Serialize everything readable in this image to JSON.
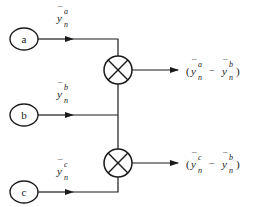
{
  "diagram": {
    "type": "signal-flow",
    "colors": {
      "stroke": "#1a1a1a",
      "background": "#ffffff"
    },
    "nodes": [
      {
        "id": "a",
        "label": "a",
        "shape": "ellipse"
      },
      {
        "id": "b",
        "label": "b",
        "shape": "ellipse"
      },
      {
        "id": "c",
        "label": "c",
        "shape": "ellipse"
      }
    ],
    "signals": [
      {
        "from": "a",
        "base": "y",
        "bar": "¯",
        "sup": "a",
        "sub": "n"
      },
      {
        "from": "b",
        "base": "y",
        "bar": "¯",
        "sup": "b",
        "sub": "n"
      },
      {
        "from": "c",
        "base": "y",
        "bar": "¯",
        "sup": "c",
        "sub": "n"
      }
    ],
    "multipliers": [
      {
        "id": "mult-1",
        "symbol": "⊗",
        "inputs": [
          "a",
          "b"
        ]
      },
      {
        "id": "mult-2",
        "symbol": "⊗",
        "inputs": [
          "b",
          "c"
        ]
      }
    ],
    "outputs": [
      {
        "from": "mult-1",
        "open": "(",
        "t1_sup": "a",
        "t1_sub": "n",
        "minus": "−",
        "t2_sup": "b",
        "t2_sub": "n",
        "close": ")",
        "base": "y"
      },
      {
        "from": "mult-2",
        "open": "(",
        "t1_sup": "c",
        "t1_sub": "n",
        "minus": "−",
        "t2_sup": "b",
        "t2_sub": "n",
        "close": ")",
        "base": "y"
      }
    ]
  }
}
